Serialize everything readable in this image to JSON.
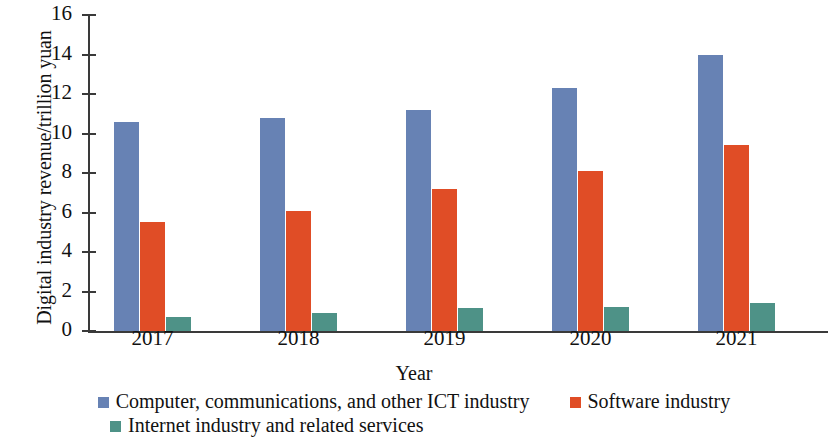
{
  "chart_data": {
    "type": "bar",
    "title": "",
    "xlabel": "Year",
    "ylabel": "Digital industry revenue/trillion yuan",
    "categories": [
      "2017",
      "2018",
      "2019",
      "2020",
      "2021"
    ],
    "series": [
      {
        "name": "Computer, communications, and other ICT industry",
        "color": "#6782B4",
        "values": [
          10.6,
          10.8,
          11.2,
          12.3,
          14.0
        ]
      },
      {
        "name": "Software industry",
        "color": "#E04D26",
        "values": [
          5.5,
          6.1,
          7.2,
          8.1,
          9.4
        ]
      },
      {
        "name": "Internet industry and related services",
        "color": "#4E9287",
        "values": [
          0.7,
          0.9,
          1.15,
          1.2,
          1.4
        ]
      }
    ],
    "ylim": [
      0,
      16
    ],
    "ytick_values": [
      0,
      2,
      4,
      6,
      8,
      10,
      12,
      14,
      16
    ],
    "ytick_labels": [
      "0",
      "2",
      "4",
      "6",
      "8",
      "10",
      "12",
      "14",
      "16"
    ],
    "grid": false,
    "legend_position": "bottom"
  }
}
